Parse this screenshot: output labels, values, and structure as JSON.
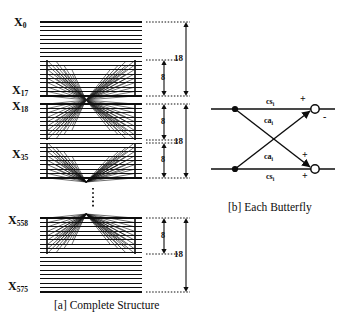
{
  "figure": {
    "panel_a": {
      "caption": "[a] Complete Structure",
      "index_labels": [
        {
          "base": "X",
          "sub": "0"
        },
        {
          "base": "X",
          "sub": "17"
        },
        {
          "base": "X",
          "sub": "18"
        },
        {
          "base": "X",
          "sub": "35"
        },
        {
          "base": "X",
          "sub": "558"
        },
        {
          "base": "X",
          "sub": "575"
        }
      ],
      "dimension_labels": [
        "18",
        "8",
        "8",
        "18",
        "8",
        "8",
        "18"
      ],
      "ellipsis": "vertical-dots"
    },
    "panel_b": {
      "caption": "[b] Each Butterfly",
      "coefficients": [
        {
          "base": "cs",
          "sub": "i"
        },
        {
          "base": "ca",
          "sub": "i"
        },
        {
          "base": "ca",
          "sub": "i"
        },
        {
          "base": "cs",
          "sub": "i"
        }
      ],
      "signs": [
        "+",
        "-",
        "+",
        "+"
      ]
    }
  },
  "colors": {
    "ink": "#0d0d0d",
    "background": "#ffffff"
  }
}
